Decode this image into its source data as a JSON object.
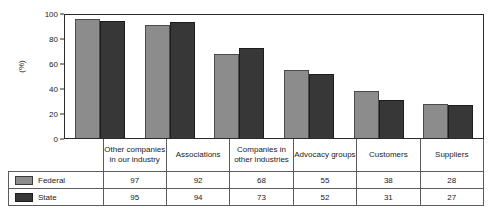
{
  "chart_data": {
    "type": "bar",
    "title": "",
    "xlabel": "",
    "ylabel": "(%)",
    "ylim": [
      0,
      100
    ],
    "yticks": [
      0,
      20,
      40,
      60,
      80,
      100
    ],
    "grid": false,
    "legend_position": "table-left-column",
    "categories": [
      "Other companies in our industry",
      "Associations",
      "Companies in other industries",
      "Advocacy groups",
      "Customers",
      "Suppliers"
    ],
    "series": [
      {
        "name": "Federal",
        "color": "#8c8c8c",
        "values": [
          97,
          92,
          68,
          55,
          38,
          28
        ]
      },
      {
        "name": "State",
        "color": "#373737",
        "values": [
          95,
          94,
          73,
          52,
          31,
          27
        ]
      }
    ]
  },
  "axis": {
    "ylabel": "(%)",
    "tick_labels": [
      "100",
      "80",
      "60",
      "40",
      "20",
      "0"
    ]
  },
  "categories": {
    "c0_line1": "Other companies",
    "c0_line2": "in our industry",
    "c1_line1": "Associations",
    "c1_line2": "",
    "c2_line1": "Companies in",
    "c2_line2": "other industries",
    "c3_line1": "Advocacy groups",
    "c3_line2": "",
    "c4_line1": "Customers",
    "c4_line2": "",
    "c5_line1": "Suppliers",
    "c5_line2": ""
  },
  "table": {
    "rows": [
      {
        "legend_label": "Federal",
        "values": [
          "97",
          "92",
          "68",
          "55",
          "38",
          "28"
        ]
      },
      {
        "legend_label": "State",
        "values": [
          "95",
          "94",
          "73",
          "52",
          "31",
          "27"
        ]
      }
    ]
  }
}
